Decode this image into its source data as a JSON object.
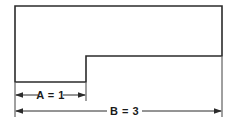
{
  "figure": {
    "type": "engineering-dimension-drawing",
    "background_color": "#ffffff",
    "line_color": "#2b2b2b",
    "text_color": "#1a1a1a",
    "shape": {
      "name": "stepped-rectangle-l-shape",
      "outline_points": "15,6 222,6 222,56 86,56 86,82 15,82",
      "stroke_width": 1.6
    },
    "dimensions": [
      {
        "id": "A",
        "label": "A = 1",
        "symbol": "A",
        "value": "1",
        "equals": "=",
        "axis": "horizontal",
        "from_x": 15,
        "to_x": 86,
        "y": 95,
        "arrow_style": "inward-arrows"
      },
      {
        "id": "B",
        "label": "B = 3",
        "symbol": "B",
        "value": "3",
        "equals": "=",
        "axis": "horizontal",
        "from_x": 15,
        "to_x": 222,
        "y": 111,
        "arrow_style": "inward-arrows"
      }
    ],
    "extension_lines": [
      {
        "id": "left",
        "x": 15,
        "from_y": 83,
        "to_y": 117
      },
      {
        "id": "step",
        "x": 86,
        "from_y": 83,
        "to_y": 101
      },
      {
        "id": "right",
        "x": 222,
        "from_y": 57,
        "to_y": 117
      }
    ]
  }
}
